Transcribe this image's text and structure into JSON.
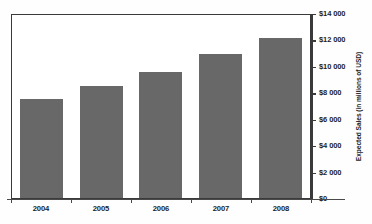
{
  "chart_data": {
    "type": "bar",
    "title": "",
    "subtitle": "",
    "xlabel": "",
    "ylabel": "Expected Sales (in millions of USD)",
    "categories": [
      "2004",
      "2005",
      "2006",
      "2007",
      "2008"
    ],
    "values": [
      7500,
      8450,
      9500,
      10900,
      12100
    ],
    "series": [
      {
        "name": "Expected Sales",
        "values": [
          7500,
          8450,
          9500,
          10900,
          12100
        ],
        "color": "#686868"
      }
    ],
    "ylim": [
      0,
      14000
    ],
    "ytick_values": [
      0,
      2000,
      4000,
      6000,
      8000,
      10000,
      12000,
      14000
    ],
    "ytick_labels": [
      "$0",
      "$2 000",
      "$4 000",
      "$6 000",
      "$8 000",
      "$10 000",
      "$12 000",
      "$14 000"
    ],
    "y_axis_position": "right",
    "grid": false,
    "legend": false,
    "legend_position": "none",
    "bar_color": "#686868",
    "axis_color": "#3a3a3a",
    "background_color": "#ffffff"
  },
  "axis": {
    "y_title": "Expected Sales (in millions of USD)",
    "ticks": [
      {
        "label": "$14 000",
        "value": 14000
      },
      {
        "label": "$12 000",
        "value": 12000
      },
      {
        "label": "$10 000",
        "value": 10000
      },
      {
        "label": "$8 000",
        "value": 8000
      },
      {
        "label": "$6 000",
        "value": 6000
      },
      {
        "label": "$4 000",
        "value": 4000
      },
      {
        "label": "$2 000",
        "value": 2000
      },
      {
        "label": "$0",
        "value": 0
      }
    ]
  }
}
